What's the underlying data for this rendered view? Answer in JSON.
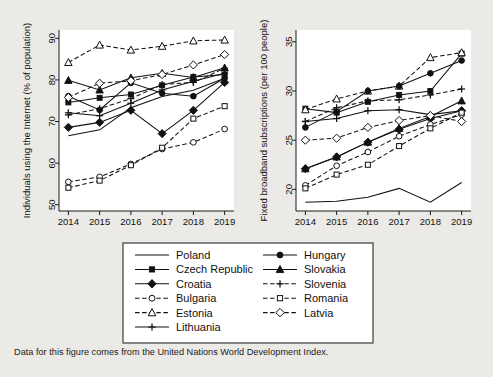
{
  "caption": "Data for this figure comes from the United Nations World Development Index.",
  "legend": {
    "columns": [
      [
        {
          "name": "Poland",
          "marker": "none",
          "style": "solid"
        },
        {
          "name": "Czech Republic",
          "marker": "square",
          "style": "solid"
        },
        {
          "name": "Croatia",
          "marker": "diamond",
          "style": "solid"
        },
        {
          "name": "Bulgaria",
          "marker": "circle-o",
          "style": "dashed"
        },
        {
          "name": "Estonia",
          "marker": "triangle-o",
          "style": "dashed"
        },
        {
          "name": "Lithuania",
          "marker": "plus",
          "style": "solid"
        }
      ],
      [
        {
          "name": "Hungary",
          "marker": "circle",
          "style": "solid"
        },
        {
          "name": "Slovakia",
          "marker": "triangle",
          "style": "solid"
        },
        {
          "name": "Slovenia",
          "marker": "plus",
          "style": "dashed"
        },
        {
          "name": "Romania",
          "marker": "square-o",
          "style": "dashed"
        },
        {
          "name": "Latvia",
          "marker": "diamond-o",
          "style": "dashed"
        }
      ]
    ]
  },
  "chart_data": [
    {
      "id": "internet",
      "type": "line",
      "title": "",
      "xlabel": "",
      "ylabel": "Individuals using the Internet (% of population)",
      "x": [
        2014,
        2015,
        2016,
        2017,
        2018,
        2019
      ],
      "xticklabels": [
        "2014",
        "2015",
        "2016",
        "2017",
        "2018",
        "2019"
      ],
      "yticks": [
        50,
        60,
        70,
        80,
        90
      ],
      "ylim": [
        48.5,
        92.0
      ],
      "xlim": [
        2013.7,
        2019.3
      ],
      "grid": false,
      "series": [
        {
          "name": "Poland",
          "marker": "none",
          "style": "solid",
          "values": [
            66.6,
            68.0,
            73.3,
            76.0,
            77.5,
            80.4
          ]
        },
        {
          "name": "Czech Republic",
          "marker": "square",
          "style": "solid",
          "values": [
            74.6,
            75.7,
            76.5,
            78.7,
            80.7,
            81.3
          ]
        },
        {
          "name": "Croatia",
          "marker": "diamond",
          "style": "solid",
          "values": [
            68.6,
            69.8,
            72.7,
            67.1,
            72.7,
            79.4
          ]
        },
        {
          "name": "Bulgaria",
          "marker": "circle-o",
          "style": "dashed",
          "values": [
            55.5,
            56.7,
            59.8,
            63.4,
            65.0,
            68.2
          ]
        },
        {
          "name": "Estonia",
          "marker": "triangle-o",
          "style": "dashed",
          "values": [
            84.2,
            88.4,
            87.2,
            88.1,
            89.4,
            89.6
          ]
        },
        {
          "name": "Lithuania",
          "marker": "plus",
          "style": "solid",
          "values": [
            72.1,
            71.4,
            74.4,
            77.6,
            79.7,
            81.6
          ]
        },
        {
          "name": "Hungary",
          "marker": "circle",
          "style": "solid",
          "values": [
            76.1,
            72.8,
            79.3,
            76.8,
            76.1,
            80.4
          ]
        },
        {
          "name": "Slovakia",
          "marker": "triangle",
          "style": "solid",
          "values": [
            79.9,
            77.6,
            80.5,
            81.6,
            80.6,
            82.9
          ]
        },
        {
          "name": "Slovenia",
          "marker": "plus",
          "style": "dashed",
          "values": [
            71.6,
            73.1,
            75.5,
            78.9,
            79.4,
            82.8
          ]
        },
        {
          "name": "Romania",
          "marker": "square-o",
          "style": "dashed",
          "values": [
            54.1,
            55.8,
            59.5,
            63.7,
            70.7,
            73.7
          ]
        },
        {
          "name": "Latvia",
          "marker": "diamond-o",
          "style": "dashed",
          "values": [
            75.8,
            79.2,
            79.8,
            81.3,
            83.6,
            86.1
          ]
        }
      ]
    },
    {
      "id": "broadband",
      "type": "line",
      "title": "",
      "xlabel": "",
      "ylabel": "Fixed broadband subscriptions (per 100 people)",
      "x": [
        2014,
        2015,
        2016,
        2017,
        2018,
        2019
      ],
      "xticklabels": [
        "2014",
        "2015",
        "2016",
        "2017",
        "2018",
        "2019"
      ],
      "yticks": [
        20,
        25,
        30,
        35
      ],
      "ylim": [
        17.8,
        36.2
      ],
      "xlim": [
        2013.7,
        2019.3
      ],
      "grid": false,
      "series": [
        {
          "name": "Poland",
          "marker": "none",
          "style": "solid",
          "values": [
            18.7,
            18.8,
            19.2,
            20.1,
            18.7,
            20.7
          ]
        },
        {
          "name": "Czech Republic",
          "marker": "square",
          "style": "solid",
          "values": [
            28.2,
            27.8,
            28.9,
            29.6,
            30.0,
            33.8
          ]
        },
        {
          "name": "Croatia",
          "marker": "diamond",
          "style": "solid",
          "values": [
            22.1,
            23.3,
            24.8,
            26.1,
            27.2,
            28.0
          ]
        },
        {
          "name": "Bulgaria",
          "marker": "circle-o",
          "style": "dashed",
          "values": [
            20.4,
            22.4,
            23.8,
            25.4,
            26.6,
            27.6
          ]
        },
        {
          "name": "Estonia",
          "marker": "triangle-o",
          "style": "dashed",
          "values": [
            28.1,
            29.2,
            30.0,
            30.5,
            33.4,
            33.9
          ]
        },
        {
          "name": "Lithuania",
          "marker": "plus",
          "style": "solid",
          "values": [
            26.9,
            27.2,
            28.0,
            28.1,
            27.6,
            28.0
          ]
        },
        {
          "name": "Hungary",
          "marker": "circle",
          "style": "solid",
          "values": [
            26.3,
            27.9,
            30.0,
            30.5,
            31.8,
            33.1
          ]
        },
        {
          "name": "Slovakia",
          "marker": "triangle",
          "style": "solid",
          "values": [
            22.1,
            23.3,
            24.8,
            26.2,
            27.4,
            29.0
          ]
        },
        {
          "name": "Slovenia",
          "marker": "plus",
          "style": "dashed",
          "values": [
            26.9,
            28.3,
            29.0,
            29.1,
            29.6,
            30.2
          ]
        },
        {
          "name": "Romania",
          "marker": "square-o",
          "style": "dashed",
          "values": [
            20.1,
            21.5,
            22.5,
            24.4,
            26.2,
            27.8
          ]
        },
        {
          "name": "Latvia",
          "marker": "diamond-o",
          "style": "dashed",
          "values": [
            25.0,
            25.2,
            26.3,
            27.0,
            27.5,
            26.9
          ]
        }
      ]
    }
  ]
}
